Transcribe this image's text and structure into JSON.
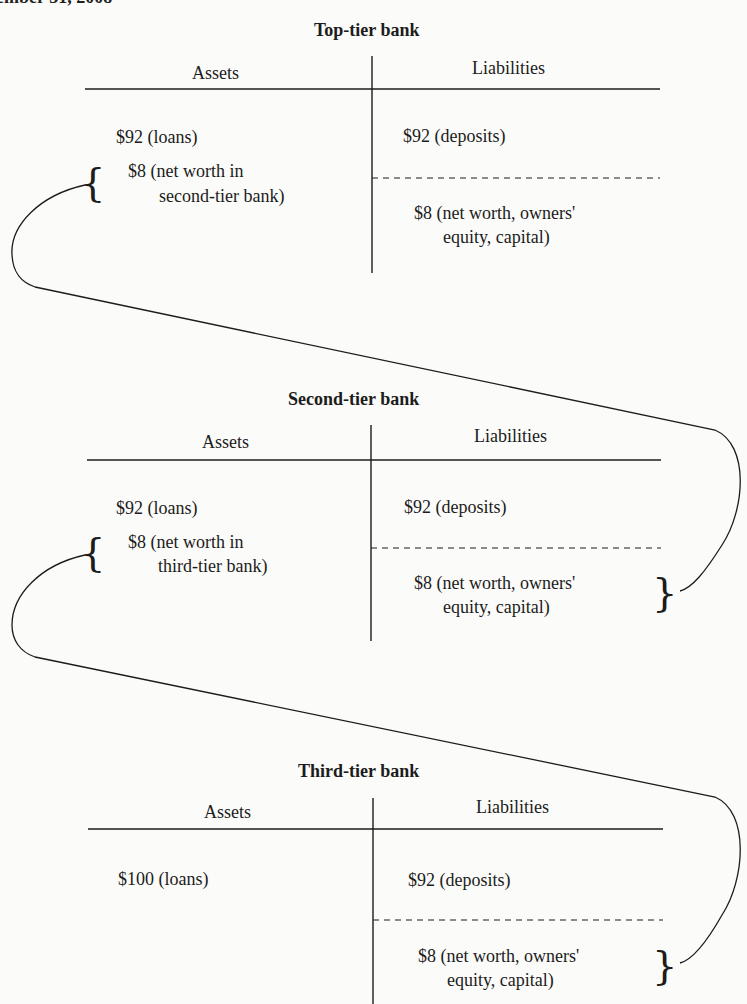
{
  "header_fragment": "ember 31, 2008",
  "banks": [
    {
      "title": "Top-tier bank",
      "assets_header": "Assets",
      "liabilities_header": "Liabilities",
      "assets": [
        {
          "line1": "$92 (loans)"
        },
        {
          "line1": "$8 (net worth in",
          "line2": "second-tier bank)"
        }
      ],
      "liabilities": [
        {
          "line1": "$92 (deposits)"
        },
        {
          "line1": "$8 (net worth, owners'",
          "line2": "equity, capital)"
        }
      ]
    },
    {
      "title": "Second-tier bank",
      "assets_header": "Assets",
      "liabilities_header": "Liabilities",
      "assets": [
        {
          "line1": "$92 (loans)"
        },
        {
          "line1": "$8 (net worth in",
          "line2": "third-tier bank)"
        }
      ],
      "liabilities": [
        {
          "line1": "$92 (deposits)"
        },
        {
          "line1": "$8 (net worth, owners'",
          "line2": "equity, capital)"
        }
      ]
    },
    {
      "title": "Third-tier bank",
      "assets_header": "Assets",
      "liabilities_header": "Liabilities",
      "assets": [
        {
          "line1": "$100 (loans)"
        }
      ],
      "liabilities": [
        {
          "line1": "$92 (deposits)"
        },
        {
          "line1": "$8 (net worth, owners'",
          "line2": "equity, capital)"
        }
      ]
    }
  ],
  "connectors": [
    {
      "from": "Top-tier bank: $8 (net worth in second-tier bank)",
      "to": "Second-tier bank: $8 (net worth, owners' equity, capital)"
    },
    {
      "from": "Second-tier bank: $8 (net worth in third-tier bank)",
      "to": "Third-tier bank: $8 (net worth, owners' equity, capital)"
    }
  ],
  "colors": {
    "ink": "#1c1c1c",
    "paper": "#fbfbf9"
  }
}
